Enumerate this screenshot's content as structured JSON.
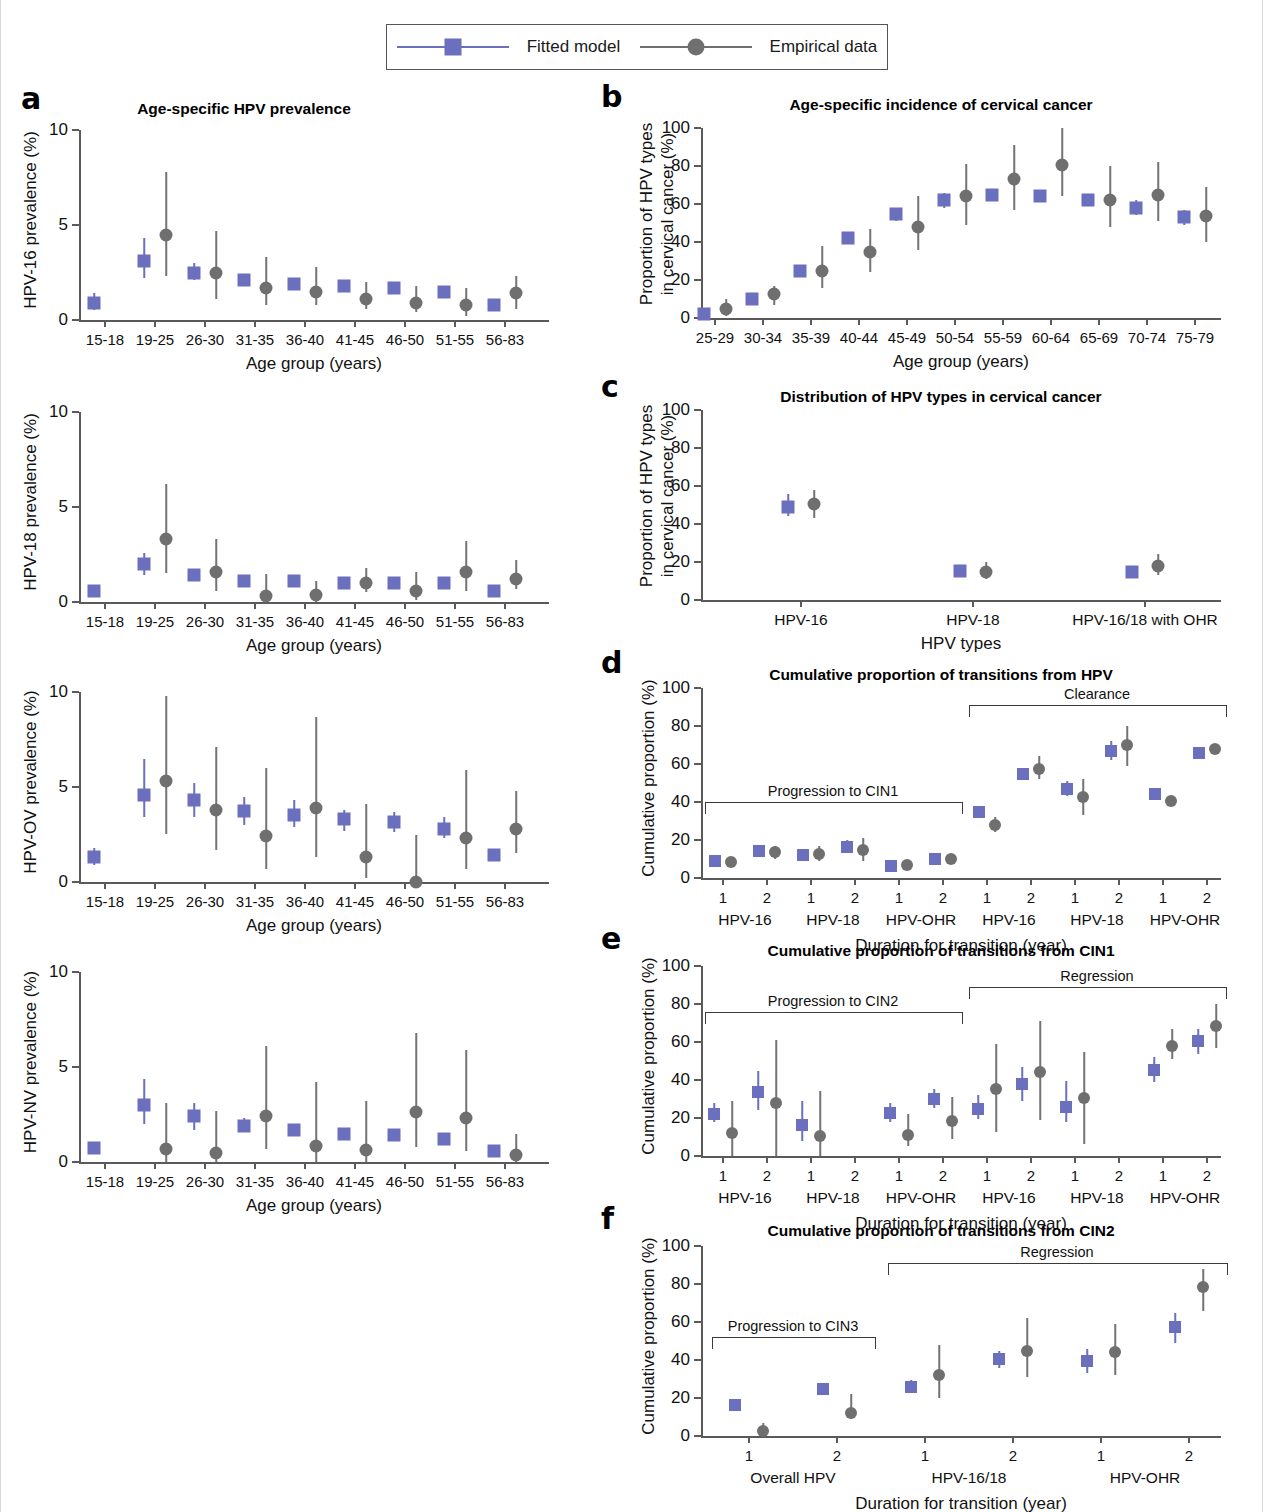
{
  "legend": {
    "items": [
      {
        "label": "Fitted model",
        "marker": "square",
        "color": "#6a6fbe"
      },
      {
        "label": "Empirical data",
        "marker": "circle",
        "color": "#6f6f6f"
      }
    ]
  },
  "axis_titles": {
    "age_group": "Age group (years)",
    "hpv_types": "HPV types",
    "duration": "Duration for transition (year)"
  },
  "panels": {
    "a": {
      "letter": "a",
      "title": "Age-specific HPV prevalence",
      "xlabel": "Age group (years)",
      "ylim": [
        0,
        10
      ],
      "yticks": [
        0,
        5,
        10
      ],
      "categories": [
        "15-18",
        "19-25",
        "26-30",
        "31-35",
        "36-40",
        "41-45",
        "46-50",
        "51-55",
        "56-83"
      ],
      "subplots": [
        {
          "ylabel": "HPV-16 prevalence (%)",
          "fitted": {
            "values": [
              0.9,
              3.1,
              2.5,
              2.1,
              1.9,
              1.8,
              1.7,
              1.5,
              0.8
            ],
            "lo": [
              0.5,
              2.2,
              2.1,
              1.8,
              1.7,
              1.6,
              1.5,
              1.3,
              0.7
            ],
            "hi": [
              1.4,
              4.3,
              3.0,
              2.4,
              2.2,
              2.0,
              1.9,
              1.8,
              0.9
            ]
          },
          "empirical": {
            "values": [
              null,
              4.5,
              2.5,
              1.7,
              1.5,
              1.1,
              0.9,
              0.8,
              1.4
            ],
            "lo": [
              null,
              2.3,
              1.1,
              0.8,
              0.8,
              0.6,
              0.4,
              0.2,
              0.6
            ],
            "hi": [
              null,
              7.8,
              4.7,
              3.3,
              2.8,
              2.0,
              1.8,
              1.7,
              2.3
            ]
          }
        },
        {
          "ylabel": "HPV-18 prevalence (%)",
          "fitted": {
            "values": [
              0.6,
              2.0,
              1.4,
              1.1,
              1.1,
              1.0,
              1.0,
              1.0,
              0.6
            ],
            "lo": [
              0.4,
              1.4,
              1.2,
              1.0,
              1.0,
              0.9,
              0.9,
              0.9,
              0.5
            ],
            "hi": [
              0.8,
              2.6,
              1.7,
              1.3,
              1.2,
              1.1,
              1.1,
              1.1,
              0.7
            ]
          },
          "empirical": {
            "values": [
              null,
              3.3,
              1.6,
              0.3,
              0.35,
              1.0,
              0.6,
              1.6,
              1.2
            ],
            "lo": [
              null,
              1.5,
              0.6,
              0.0,
              0.0,
              0.5,
              0.1,
              0.6,
              0.7
            ],
            "hi": [
              null,
              6.2,
              3.3,
              1.5,
              1.1,
              1.8,
              1.6,
              3.2,
              2.2
            ]
          }
        },
        {
          "ylabel": "HPV-OV prevalence (%)",
          "fitted": {
            "values": [
              1.3,
              4.6,
              4.3,
              3.75,
              3.55,
              3.3,
              3.15,
              2.8,
              1.4
            ],
            "lo": [
              0.9,
              3.4,
              3.4,
              3.0,
              2.9,
              2.7,
              2.65,
              2.3,
              1.2
            ],
            "hi": [
              1.8,
              6.5,
              5.2,
              4.5,
              4.3,
              3.8,
              3.7,
              3.4,
              1.7
            ]
          },
          "empirical": {
            "values": [
              null,
              5.3,
              3.8,
              2.4,
              3.9,
              1.3,
              0.0,
              2.3,
              2.8
            ],
            "lo": [
              null,
              2.5,
              1.7,
              0.7,
              1.3,
              0.2,
              0.0,
              0.7,
              1.5
            ],
            "hi": [
              null,
              9.8,
              7.1,
              6.0,
              8.7,
              4.1,
              2.5,
              5.9,
              4.8
            ]
          }
        },
        {
          "ylabel": "HPV-NV prevalence (%)",
          "fitted": {
            "values": [
              0.75,
              3.0,
              2.4,
              1.9,
              1.7,
              1.5,
              1.4,
              1.2,
              0.6
            ],
            "lo": [
              0.5,
              2.0,
              1.7,
              1.6,
              1.4,
              1.2,
              1.1,
              0.9,
              0.5
            ],
            "hi": [
              1.0,
              4.35,
              3.1,
              2.3,
              2.0,
              1.8,
              1.7,
              1.5,
              0.7
            ]
          },
          "empirical": {
            "values": [
              null,
              0.7,
              0.5,
              2.4,
              0.85,
              0.65,
              2.65,
              2.3,
              0.35
            ],
            "lo": [
              null,
              0.0,
              0.0,
              0.7,
              0.0,
              0.0,
              0.8,
              0.6,
              0.0
            ],
            "hi": [
              null,
              3.1,
              2.7,
              6.1,
              4.2,
              3.2,
              6.8,
              5.9,
              1.5
            ]
          }
        }
      ]
    },
    "b": {
      "letter": "b",
      "title": "Age-specific incidence of cervical cancer",
      "ylabel": "Proportion of HPV types in cervical cancer (%)",
      "ylabel_l1": "Proportion of HPV types",
      "ylabel_l2": "in cervical cancer (%)",
      "xlabel": "Age group (years)",
      "ylim": [
        0,
        100
      ],
      "yticks": [
        0,
        20,
        40,
        60,
        80,
        100
      ],
      "categories": [
        "25-29",
        "30-34",
        "35-39",
        "40-44",
        "45-49",
        "50-54",
        "55-59",
        "60-64",
        "65-69",
        "70-74",
        "75-79"
      ],
      "fitted": {
        "values": [
          2,
          10,
          25,
          42,
          55,
          62,
          65,
          64,
          62,
          58,
          53
        ],
        "lo": [
          1,
          8,
          23,
          39,
          51,
          58,
          62,
          61,
          59,
          54,
          49
        ],
        "hi": [
          3,
          12,
          28,
          45,
          58,
          66,
          68,
          67,
          65,
          62,
          57
        ]
      },
      "empirical": {
        "values": [
          5,
          12.5,
          24.5,
          34.5,
          48,
          64,
          73,
          80.5,
          62,
          65,
          53.5
        ],
        "lo": [
          1,
          7,
          16,
          24,
          36,
          49,
          57,
          64,
          48,
          51,
          40
        ],
        "hi": [
          10,
          17,
          38,
          47,
          64,
          81,
          91,
          100,
          80,
          82,
          69
        ]
      }
    },
    "c": {
      "letter": "c",
      "title": "Distribution of HPV types in cervical cancer",
      "ylabel_l1": "Proportion of HPV types",
      "ylabel_l2": "in cervical cancer (%)",
      "xlabel": "HPV types",
      "ylim": [
        0,
        100
      ],
      "yticks": [
        0,
        20,
        40,
        60,
        80,
        100
      ],
      "categories": [
        "HPV-16",
        "HPV-18",
        "HPV-16/18 with OHR"
      ],
      "fitted": {
        "values": [
          49,
          15.5,
          14.5
        ],
        "lo": [
          44,
          13,
          12.5
        ],
        "hi": [
          56,
          18.5,
          17
        ]
      },
      "empirical": {
        "values": [
          50.5,
          14.5,
          18
        ],
        "lo": [
          43,
          11,
          13
        ],
        "hi": [
          58,
          20,
          24
        ]
      }
    },
    "d": {
      "letter": "d",
      "title": "Cumulative proportion of transitions from HPV",
      "ylabel": "Cumulative proportion (%)",
      "xlabel": "Duration for transition (year)",
      "ylim": [
        0,
        100
      ],
      "yticks": [
        0,
        20,
        40,
        60,
        80,
        100
      ],
      "durations": [
        "1",
        "2",
        "1",
        "2",
        "1",
        "2",
        "1",
        "2",
        "1",
        "2",
        "1",
        "2"
      ],
      "groups": [
        "HPV-16",
        "HPV-18",
        "HPV-OHR",
        "HPV-16",
        "HPV-18",
        "HPV-OHR"
      ],
      "brackets": [
        {
          "label": "Progression to CIN1",
          "start": 0,
          "end": 5,
          "y": 40
        },
        {
          "label": "Clearance",
          "start": 6,
          "end": 11,
          "y": 91
        }
      ],
      "fitted": {
        "values": [
          9,
          14,
          12,
          16.5,
          6.5,
          10,
          35,
          55,
          47,
          67,
          44,
          66
        ],
        "lo": [
          7.5,
          12,
          10,
          13.5,
          5.5,
          9,
          33,
          52,
          43,
          62,
          43,
          65
        ],
        "hi": [
          11,
          16.5,
          14.5,
          20,
          7.5,
          11.5,
          37.5,
          58,
          51,
          72,
          46,
          68
        ]
      },
      "empirical": {
        "values": [
          8.5,
          13.5,
          12.5,
          15,
          7,
          10,
          28,
          57.5,
          42.5,
          70,
          40.5,
          68
        ],
        "lo": [
          7,
          10,
          9,
          9,
          6,
          9,
          24,
          52,
          33,
          59,
          38.5,
          66
        ],
        "hi": [
          10,
          17,
          17,
          21,
          8.5,
          12,
          32,
          64,
          52,
          80,
          43,
          70
        ]
      }
    },
    "e": {
      "letter": "e",
      "title": "Cumulative proportion of transitions from CIN1",
      "ylabel": "Cumulative proportion (%)",
      "xlabel": "Duration for transition (year)",
      "ylim": [
        0,
        100
      ],
      "yticks": [
        0,
        20,
        40,
        60,
        80,
        100
      ],
      "durations": [
        "1",
        "2",
        "1",
        "2",
        "1",
        "2",
        "1",
        "2",
        "1",
        "2",
        "1",
        "2"
      ],
      "groups": [
        "HPV-16",
        "HPV-18",
        "HPV-OHR",
        "HPV-16",
        "HPV-18",
        "HPV-OHR"
      ],
      "brackets": [
        {
          "label": "Progression to CIN2",
          "start": 0,
          "end": 5,
          "y": 76
        },
        {
          "label": "Regression",
          "start": 6,
          "end": 11,
          "y": 89
        }
      ],
      "fitted": {
        "values": [
          22,
          33.5,
          16.5,
          null,
          22.5,
          30,
          25,
          38,
          26,
          null,
          45.5,
          60.5
        ],
        "lo": [
          18,
          24,
          8,
          null,
          18,
          25,
          19.5,
          29,
          18,
          null,
          39,
          53.5
        ],
        "hi": [
          28,
          45,
          29,
          null,
          28,
          35.5,
          32,
          47,
          39.5,
          null,
          52,
          67
        ]
      },
      "empirical": {
        "values": [
          12,
          28,
          10.5,
          null,
          11,
          18.5,
          35.5,
          44,
          30.5,
          null,
          58,
          68.5
        ],
        "lo": [
          0,
          0,
          0,
          null,
          5,
          9,
          12.5,
          19,
          6.5,
          null,
          51,
          57
        ]
      },
      "empirical_hi": [
        29,
        61,
        34,
        null,
        22,
        31,
        59,
        71,
        55,
        null,
        67,
        80
      ]
    },
    "f": {
      "letter": "f",
      "title": "Cumulative proportion of transitions from CIN2",
      "ylabel": "Cumulative proportion (%)",
      "xlabel": "Duration for transition (year)",
      "ylim": [
        0,
        100
      ],
      "yticks": [
        0,
        20,
        40,
        60,
        80,
        100
      ],
      "durations": [
        "1",
        "2",
        "1",
        "2",
        "1",
        "2"
      ],
      "groups": [
        "Overall HPV",
        "HPV-16/18",
        "HPV-OHR"
      ],
      "brackets": [
        {
          "label": "Progression to CIN3",
          "start": 0,
          "end": 1,
          "y": 52
        },
        {
          "label": "Regression",
          "start": 2,
          "end": 5,
          "y": 91
        }
      ],
      "fitted": {
        "values": [
          16.5,
          24.5,
          26,
          40.5,
          39.5,
          57.5
        ],
        "lo": [
          14,
          22,
          23,
          36,
          33,
          49
        ],
        "hi": [
          19,
          28,
          29.5,
          45,
          46,
          65
        ]
      },
      "empirical": {
        "values": [
          2.5,
          12,
          32,
          44.5,
          44,
          78.5
        ],
        "lo": [
          0,
          9,
          20,
          31,
          32,
          66
        ],
        "hi": [
          7,
          22,
          48,
          62,
          59,
          88
        ]
      }
    }
  }
}
